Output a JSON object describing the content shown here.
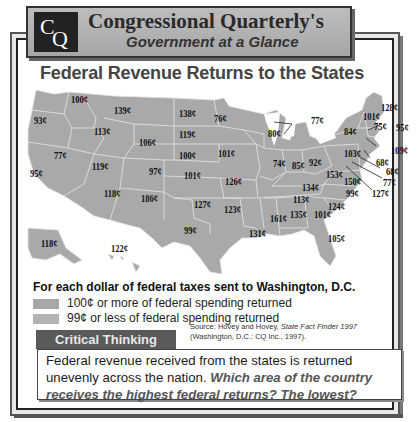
{
  "header": {
    "logo_c": "C",
    "logo_q": "Q",
    "brand_title": "Congressional Quarterly's",
    "brand_subtitle": "Government at a Glance"
  },
  "map_title": "Federal Revenue Returns to the States",
  "legend": {
    "heading": "For each dollar of federal taxes sent to Washington, D.C.",
    "items": [
      {
        "label": "100¢ or more of federal spending returned",
        "color": "#a8a8a8"
      },
      {
        "label": "99¢ or less of federal spending returned",
        "color": "#b3b3b3"
      }
    ]
  },
  "critical_thinking": {
    "tab_label": "Critical Thinking",
    "text_plain": "Federal revenue received from the states is returned unevenly across the nation.",
    "text_question": "Which area of the country receives the highest federal returns? The lowest?"
  },
  "source": {
    "prefix": "Source: Hovey and Hovey, ",
    "title": "State Fact Finder 1997",
    "publisher": "(Washington, D.C.: CQ Inc., 1997)."
  },
  "chart_data": {
    "type": "choropleth_map",
    "title": "Federal Revenue Returns to the States",
    "unit": "cents returned per dollar of federal taxes",
    "legend": [
      "100¢ or more of federal spending returned",
      "99¢ or less of federal spending returned"
    ],
    "states": [
      {
        "state": "Washington",
        "value": 100,
        "label": "100¢"
      },
      {
        "state": "Oregon",
        "value": 93,
        "label": "93¢"
      },
      {
        "state": "California",
        "value": 95,
        "label": "95¢"
      },
      {
        "state": "Nevada",
        "value": 77,
        "label": "77¢"
      },
      {
        "state": "Idaho",
        "value": 113,
        "label": "113¢"
      },
      {
        "state": "Montana",
        "value": 139,
        "label": "139¢"
      },
      {
        "state": "Wyoming",
        "value": 106,
        "label": "106¢"
      },
      {
        "state": "Utah",
        "value": 119,
        "label": "119¢"
      },
      {
        "state": "Colorado",
        "value": 97,
        "label": "97¢"
      },
      {
        "state": "Arizona",
        "value": 118,
        "label": "118¢"
      },
      {
        "state": "New Mexico",
        "value": 186,
        "label": "186¢"
      },
      {
        "state": "North Dakota",
        "value": 138,
        "label": "138¢"
      },
      {
        "state": "South Dakota",
        "value": 119,
        "label": "119¢"
      },
      {
        "state": "Nebraska",
        "value": 100,
        "label": "100¢"
      },
      {
        "state": "Kansas",
        "value": 101,
        "label": "101¢"
      },
      {
        "state": "Oklahoma",
        "value": 127,
        "label": "127¢"
      },
      {
        "state": "Texas",
        "value": 99,
        "label": "99¢"
      },
      {
        "state": "Minnesota",
        "value": 76,
        "label": "76¢"
      },
      {
        "state": "Iowa",
        "value": 101,
        "label": "101¢"
      },
      {
        "state": "Missouri",
        "value": 126,
        "label": "126¢"
      },
      {
        "state": "Arkansas",
        "value": 123,
        "label": "123¢"
      },
      {
        "state": "Louisiana",
        "value": 131,
        "label": "131¢"
      },
      {
        "state": "Wisconsin",
        "value": 80,
        "label": "80¢"
      },
      {
        "state": "Illinois",
        "value": 74,
        "label": "74¢"
      },
      {
        "state": "Michigan",
        "value": 77,
        "label": "77¢"
      },
      {
        "state": "Indiana",
        "value": 85,
        "label": "85¢"
      },
      {
        "state": "Ohio",
        "value": 92,
        "label": "92¢"
      },
      {
        "state": "Kentucky",
        "value": 134,
        "label": "134¢"
      },
      {
        "state": "Tennessee",
        "value": 113,
        "label": "113¢"
      },
      {
        "state": "Mississippi",
        "value": 161,
        "label": "161¢"
      },
      {
        "state": "Alabama",
        "value": 135,
        "label": "135¢"
      },
      {
        "state": "Georgia",
        "value": 101,
        "label": "101¢"
      },
      {
        "state": "Florida",
        "value": 105,
        "label": "105¢"
      },
      {
        "state": "South Carolina",
        "value": 124,
        "label": "124¢"
      },
      {
        "state": "North Carolina",
        "value": 99,
        "label": "99¢"
      },
      {
        "state": "Virginia",
        "value": 150,
        "label": "150¢"
      },
      {
        "state": "West Virginia",
        "value": 153,
        "label": "153¢"
      },
      {
        "state": "Pennsylvania",
        "value": 103,
        "label": "103¢"
      },
      {
        "state": "New York",
        "value": 84,
        "label": "84¢"
      },
      {
        "state": "Vermont",
        "value": 101,
        "label": "101¢"
      },
      {
        "state": "New Hampshire",
        "value": 75,
        "label": "75¢"
      },
      {
        "state": "Maine",
        "value": 128,
        "label": "128¢"
      },
      {
        "state": "Massachusetts",
        "value": 95,
        "label": "95¢"
      },
      {
        "state": "Rhode Island",
        "value": 109,
        "label": "109¢"
      },
      {
        "state": "Connecticut",
        "value": 68,
        "label": "68¢"
      },
      {
        "state": "New Jersey",
        "value": 68,
        "label": "68¢"
      },
      {
        "state": "Delaware",
        "value": 77,
        "label": "77¢"
      },
      {
        "state": "Maryland",
        "value": 127,
        "label": "127¢"
      },
      {
        "state": "Alaska",
        "value": 118,
        "label": "118¢"
      },
      {
        "state": "Hawaii",
        "value": 122,
        "label": "122¢"
      }
    ]
  },
  "map_labels": [
    {
      "t": "100¢",
      "x": 47,
      "y": 6
    },
    {
      "t": "93¢",
      "x": 10,
      "y": 27
    },
    {
      "t": "139¢",
      "x": 90,
      "y": 17
    },
    {
      "t": "138¢",
      "x": 155,
      "y": 20
    },
    {
      "t": "76¢",
      "x": 190,
      "y": 25
    },
    {
      "t": "113¢",
      "x": 70,
      "y": 38
    },
    {
      "t": "119¢",
      "x": 155,
      "y": 41
    },
    {
      "t": "106¢",
      "x": 115,
      "y": 49
    },
    {
      "t": "80¢",
      "x": 244,
      "y": 40
    },
    {
      "t": "77¢",
      "x": 287,
      "y": 27
    },
    {
      "t": "77¢",
      "x": 30,
      "y": 62
    },
    {
      "t": "100¢",
      "x": 155,
      "y": 62
    },
    {
      "t": "101¢",
      "x": 194,
      "y": 60
    },
    {
      "t": "119¢",
      "x": 68,
      "y": 73
    },
    {
      "t": "97¢",
      "x": 125,
      "y": 78
    },
    {
      "t": "74¢",
      "x": 249,
      "y": 70
    },
    {
      "t": "85¢",
      "x": 268,
      "y": 72
    },
    {
      "t": "92¢",
      "x": 285,
      "y": 69
    },
    {
      "t": "103¢",
      "x": 320,
      "y": 60
    },
    {
      "t": "84¢",
      "x": 320,
      "y": 38
    },
    {
      "t": "101¢",
      "x": 339,
      "y": 23
    },
    {
      "t": "75¢",
      "x": 350,
      "y": 33
    },
    {
      "t": "128¢",
      "x": 357,
      "y": 14
    },
    {
      "t": "95¢",
      "x": 372,
      "y": 34
    },
    {
      "t": "109¢",
      "x": 367,
      "y": 57
    },
    {
      "t": "68¢",
      "x": 352,
      "y": 69
    },
    {
      "t": "68¢",
      "x": 362,
      "y": 78
    },
    {
      "t": "77¢",
      "x": 359,
      "y": 89
    },
    {
      "t": "127¢",
      "x": 348,
      "y": 100
    },
    {
      "t": "95¢",
      "x": 6,
      "y": 80
    },
    {
      "t": "101¢",
      "x": 160,
      "y": 82
    },
    {
      "t": "126¢",
      "x": 201,
      "y": 88
    },
    {
      "t": "153¢",
      "x": 302,
      "y": 81
    },
    {
      "t": "150¢",
      "x": 320,
      "y": 88
    },
    {
      "t": "134¢",
      "x": 278,
      "y": 94
    },
    {
      "t": "99¢",
      "x": 322,
      "y": 100
    },
    {
      "t": "118¢",
      "x": 80,
      "y": 100
    },
    {
      "t": "186¢",
      "x": 117,
      "y": 105
    },
    {
      "t": "127¢",
      "x": 170,
      "y": 111
    },
    {
      "t": "113¢",
      "x": 269,
      "y": 106
    },
    {
      "t": "124¢",
      "x": 304,
      "y": 113
    },
    {
      "t": "123¢",
      "x": 200,
      "y": 116
    },
    {
      "t": "161¢",
      "x": 246,
      "y": 125
    },
    {
      "t": "135¢",
      "x": 266,
      "y": 121
    },
    {
      "t": "101¢",
      "x": 290,
      "y": 121
    },
    {
      "t": "99¢",
      "x": 160,
      "y": 137
    },
    {
      "t": "131¢",
      "x": 225,
      "y": 140
    },
    {
      "t": "105¢",
      "x": 304,
      "y": 145
    },
    {
      "t": "118¢",
      "x": 17,
      "y": 150
    },
    {
      "t": "122¢",
      "x": 87,
      "y": 155
    }
  ]
}
